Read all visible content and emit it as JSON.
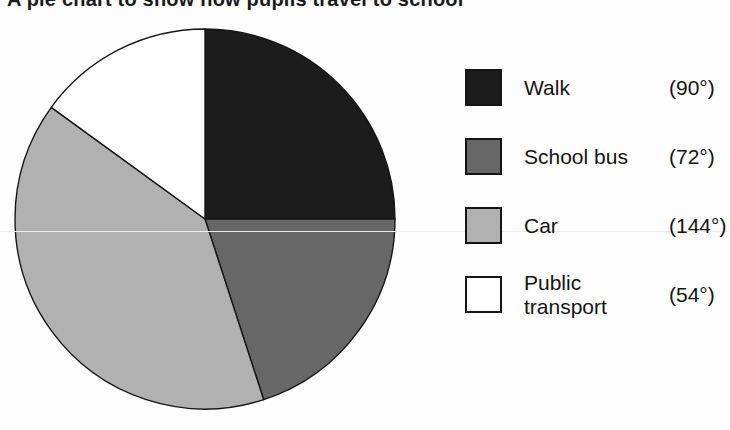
{
  "title": "A pie chart to show how pupils travel to school",
  "legend": {
    "items": [
      {
        "label": "Walk",
        "degrees": "(90°)",
        "color": "#1c1c1c"
      },
      {
        "label": "School bus",
        "degrees": "(72°)",
        "color": "#676767"
      },
      {
        "label": "Car",
        "degrees": "(144°)",
        "color": "#b1b1b1"
      },
      {
        "label": "Public transport",
        "degrees": "(54°)",
        "color": "#ffffff"
      }
    ]
  },
  "chart_data": {
    "type": "pie",
    "title": "A pie chart to show how pupils travel to school",
    "start_angle_deg": 0,
    "direction": "clockwise",
    "legend_position": "right",
    "segments": [
      {
        "label": "Walk",
        "angle_deg": 90,
        "fraction": 0.25,
        "color": "#1c1c1c"
      },
      {
        "label": "School bus",
        "angle_deg": 72,
        "fraction": 0.2,
        "color": "#676767"
      },
      {
        "label": "Car",
        "angle_deg": 144,
        "fraction": 0.4,
        "color": "#b1b1b1"
      },
      {
        "label": "Public transport",
        "angle_deg": 54,
        "fraction": 0.15,
        "color": "#ffffff"
      }
    ],
    "outline_color": "#161616"
  }
}
